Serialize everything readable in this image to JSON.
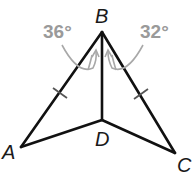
{
  "figure": {
    "type": "geometry-diagram",
    "points": {
      "A": {
        "label": "A",
        "x": 21,
        "y": 147
      },
      "B": {
        "label": "B",
        "x": 102,
        "y": 32
      },
      "C": {
        "label": "C",
        "x": 175,
        "y": 153
      },
      "D": {
        "label": "D",
        "x": 102,
        "y": 120
      }
    },
    "segments": [
      "AB",
      "BC",
      "BD",
      "AD",
      "DC"
    ],
    "congruent_marks": [
      "AB",
      "BC"
    ],
    "angles": [
      {
        "name": "ABD",
        "label": "36°"
      },
      {
        "name": "DBC",
        "label": "32°"
      }
    ],
    "colors": {
      "lines": "#111111",
      "angle_annotation": "#9a9a9a"
    }
  }
}
